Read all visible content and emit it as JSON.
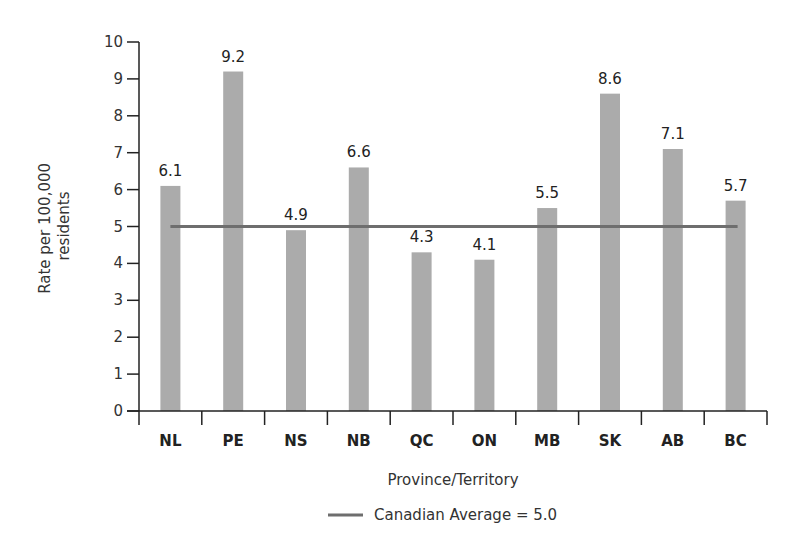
{
  "chart_data": {
    "type": "bar",
    "title": "",
    "xlabel": "Province/Territory",
    "ylabel": "Rate per 100,000 residents",
    "ylabel_lines": [
      "Rate per 100,000",
      "residents"
    ],
    "categories": [
      "NL",
      "PE",
      "NS",
      "NB",
      "QC",
      "ON",
      "MB",
      "SK",
      "AB",
      "BC"
    ],
    "values": [
      6.1,
      9.2,
      4.9,
      6.6,
      4.3,
      4.1,
      5.5,
      8.6,
      7.1,
      5.7
    ],
    "data_labels": [
      "6.1",
      "9.2",
      "4.9",
      "6.6",
      "4.3",
      "4.1",
      "5.5",
      "8.6",
      "7.1",
      "5.7"
    ],
    "ylim": [
      0,
      10
    ],
    "yticks": [
      0,
      1,
      2,
      3,
      4,
      5,
      6,
      7,
      8,
      9,
      10
    ],
    "grid": false,
    "reference_line": {
      "name": "Canadian Average",
      "value": 5.0
    },
    "legend": {
      "position": "bottom",
      "entries": [
        "Canadian Average = 5.0"
      ]
    },
    "colors": {
      "bar": "#ababab",
      "average_line": "#6e6e6e",
      "axis": "#222222"
    }
  }
}
